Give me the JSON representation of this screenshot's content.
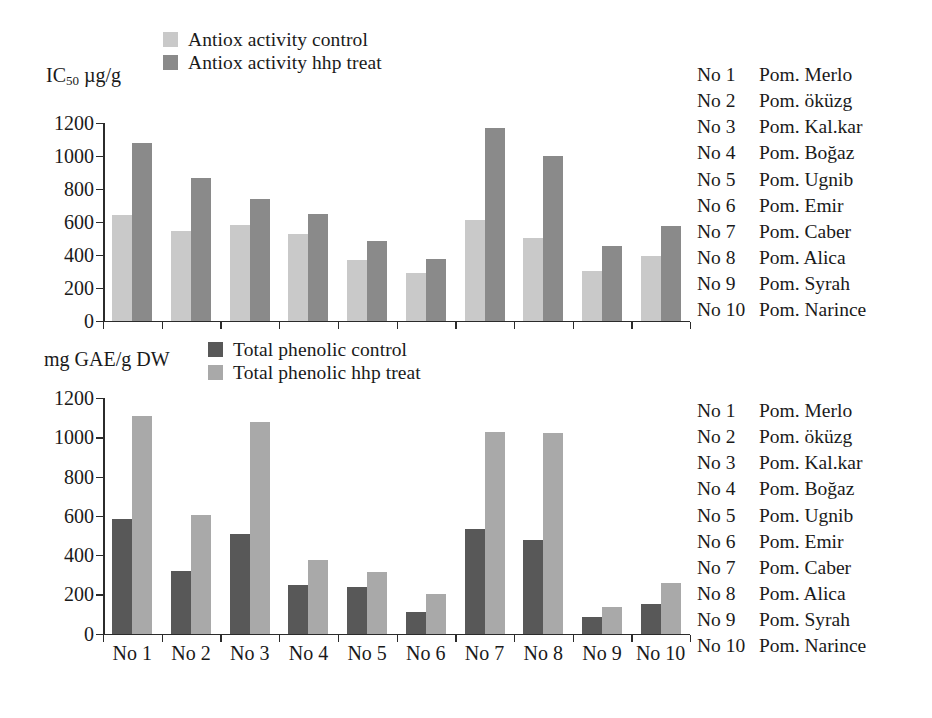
{
  "figure": {
    "background": "#ffffff"
  },
  "colors": {
    "antiox_control": "#c9c9c9",
    "antiox_hhp": "#8a8a8a",
    "phenolic_control": "#585858",
    "phenolic_hhp": "#a9a9a9",
    "axis": "#2b2b2b",
    "text": "#1a1a1a"
  },
  "top_panel": {
    "axis_title": "IC",
    "axis_title_sub": "50",
    "axis_title_tail": " µg/g",
    "legend": [
      {
        "label": "Antiox activity control",
        "color": "#c9c9c9"
      },
      {
        "label": "Antiox activity hhp treat",
        "color": "#8a8a8a"
      }
    ]
  },
  "bottom_panel": {
    "axis_title": "mg GAE/g DW",
    "legend": [
      {
        "label": "Total phenolic control",
        "color": "#585858"
      },
      {
        "label": "Total phenolic hhp treat",
        "color": "#a9a9a9"
      }
    ]
  },
  "code_list": [
    {
      "no": "No 1",
      "name": "Pom. Merlo"
    },
    {
      "no": "No 2",
      "name": "Pom. öküzg"
    },
    {
      "no": "No 3",
      "name": "Pom. Kal.kar"
    },
    {
      "no": "No 4",
      "name": "Pom. Boğaz"
    },
    {
      "no": "No 5",
      "name": "Pom. Ugnib"
    },
    {
      "no": "No 6",
      "name": "Pom. Emir"
    },
    {
      "no": "No 7",
      "name": "Pom. Caber"
    },
    {
      "no": "No 8",
      "name": "Pom. Alica"
    },
    {
      "no": "No 9",
      "name": "Pom. Syrah"
    },
    {
      "no": "No 10",
      "name": "Pom. Narince"
    }
  ],
  "chart_data": [
    {
      "type": "bar",
      "title": "",
      "xlabel": "",
      "ylabel": "IC50 µg/g",
      "ylim": [
        0,
        1200
      ],
      "yticks": [
        0,
        200,
        400,
        600,
        800,
        1000,
        1200
      ],
      "grid": false,
      "legend_position": "top-left",
      "categories": [
        "No 1",
        "No 2",
        "No 3",
        "No 4",
        "No 5",
        "No 6",
        "No 7",
        "No 8",
        "No 9",
        "No 10"
      ],
      "series": [
        {
          "name": "Antiox activity control",
          "color": "#c9c9c9",
          "values": [
            640,
            545,
            580,
            525,
            365,
            290,
            610,
            500,
            300,
            395
          ]
        },
        {
          "name": "Antiox activity hhp treat",
          "color": "#8a8a8a",
          "values": [
            1080,
            865,
            740,
            645,
            485,
            375,
            1170,
            1000,
            455,
            575
          ]
        }
      ]
    },
    {
      "type": "bar",
      "title": "",
      "xlabel": "",
      "ylabel": "mg GAE/g DW",
      "ylim": [
        0,
        1200
      ],
      "yticks": [
        0,
        200,
        400,
        600,
        800,
        1000,
        1200
      ],
      "grid": false,
      "legend_position": "top-left",
      "categories": [
        "No 1",
        "No 2",
        "No 3",
        "No 4",
        "No 5",
        "No 6",
        "No 7",
        "No 8",
        "No 9",
        "No 10"
      ],
      "series": [
        {
          "name": "Total phenolic control",
          "color": "#585858",
          "values": [
            585,
            318,
            505,
            247,
            235,
            112,
            532,
            475,
            85,
            150
          ]
        },
        {
          "name": "Total phenolic hhp treat",
          "color": "#a9a9a9",
          "values": [
            1110,
            602,
            1080,
            375,
            312,
            203,
            1025,
            1022,
            135,
            255
          ]
        }
      ]
    }
  ]
}
